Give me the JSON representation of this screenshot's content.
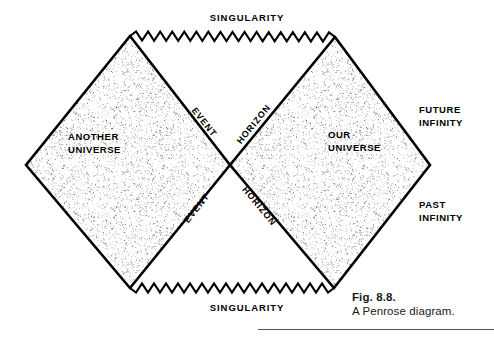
{
  "figure": {
    "caption_number": "Fig. 8.8.",
    "caption_text": "A Penrose diagram.",
    "ink_color": "#000000",
    "background_color": "#ffffff",
    "stipple_color": "#2b2b2b",
    "rule_color": "#555555"
  },
  "labels": {
    "singularity_top": "SINGULARITY",
    "singularity_bottom": "SINGULARITY",
    "another_universe_line1": "ANOTHER",
    "another_universe_line2": "UNIVERSE",
    "our_universe_line1": "OUR",
    "our_universe_line2": "UNIVERSE",
    "future_infinity_line1": "FUTURE",
    "future_infinity_line2": "INFINITY",
    "past_infinity_line1": "PAST",
    "past_infinity_line2": "INFINITY",
    "event_upper": "EVENT",
    "horizon_upper": "HORIZON",
    "event_lower": "EVENT",
    "horizon_lower": "HORIZON"
  },
  "chart_data": {
    "type": "diagram",
    "title": "A Penrose diagram",
    "regions": [
      {
        "name": "ANOTHER UNIVERSE",
        "shape": "diamond",
        "fill": "stipple",
        "vertices": [
          [
            130,
            36
          ],
          [
            230,
            165
          ],
          [
            130,
            288
          ],
          [
            26,
            165
          ]
        ],
        "label_position": [
          68,
          136
        ]
      },
      {
        "name": "OUR UNIVERSE",
        "shape": "diamond",
        "fill": "stipple",
        "vertices": [
          [
            335,
            37
          ],
          [
            430,
            165
          ],
          [
            334,
            288
          ],
          [
            230,
            165
          ]
        ],
        "label_position": [
          325,
          133
        ]
      }
    ],
    "boundaries": [
      {
        "name": "SINGULARITY",
        "style": "zigzag",
        "position": "top",
        "from": [
          130,
          36
        ],
        "to": [
          335,
          37
        ],
        "label_position": [
          247,
          18
        ]
      },
      {
        "name": "SINGULARITY",
        "style": "zigzag",
        "position": "bottom",
        "from": [
          130,
          288
        ],
        "to": [
          334,
          288
        ],
        "label_position": [
          247,
          307
        ]
      }
    ],
    "lines": [
      {
        "name": "EVENT HORIZON (upper-left to center)",
        "from": [
          130,
          36
        ],
        "to": [
          230,
          165
        ],
        "label": "EVENT",
        "rotation_deg": 52
      },
      {
        "name": "EVENT HORIZON (center to upper-right)",
        "from": [
          230,
          165
        ],
        "to": [
          335,
          37
        ],
        "label": "HORIZON",
        "rotation_deg": -51
      },
      {
        "name": "EVENT HORIZON (lower-left to center)",
        "from": [
          130,
          288
        ],
        "to": [
          230,
          165
        ],
        "label": "EVENT",
        "rotation_deg": -51
      },
      {
        "name": "EVENT HORIZON (center to lower-right)",
        "from": [
          230,
          165
        ],
        "to": [
          334,
          288
        ],
        "label": "HORIZON",
        "rotation_deg": 50
      }
    ],
    "annotations": [
      {
        "text": "FUTURE INFINITY",
        "position": [
          448,
          116
        ],
        "points_to": [
          430,
          165
        ]
      },
      {
        "text": "PAST INFINITY",
        "position": [
          448,
          211
        ],
        "points_to": [
          430,
          165
        ]
      }
    ],
    "axis_labels": {
      "x": "",
      "y": ""
    },
    "legend": null,
    "grid": false
  }
}
